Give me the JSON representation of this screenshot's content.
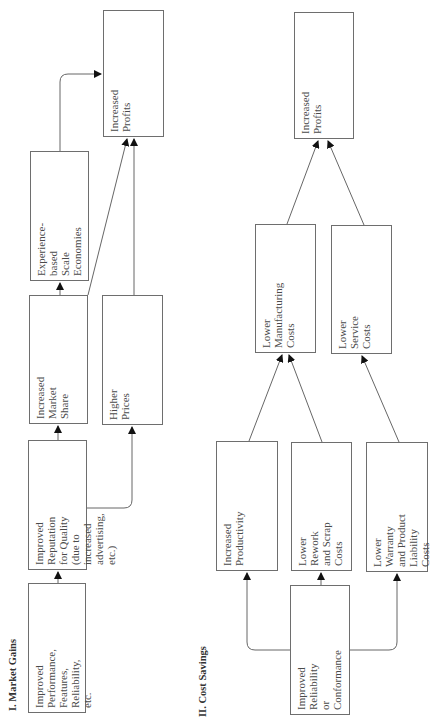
{
  "sections": [
    {
      "title": "I. Market Gains",
      "boxes": {
        "performance": "Improved Performance,\nFeatures, Reliability, etc.",
        "reputation": "Improved Reputation\nfor Quality (due to\nincreased advertising,\netc.)",
        "market_share": "Increased Market\nShare",
        "scale": "Experience-based\nScale Economies",
        "prices": "Higher Prices",
        "profits": "Increased Profits"
      }
    },
    {
      "title": "II. Cost Savings",
      "boxes": {
        "reliability": "Improved Reliability\nor Conformance",
        "productivity": "Increased\nProductivity",
        "rework": "Lower Rework\nand Scrap Costs",
        "warranty": "Lower Warranty\nand Product\nLiability Costs",
        "manufacturing": "Lower\nManufacturing\nCosts",
        "service": "Lower Service\nCosts",
        "profits": "Increased Profits"
      }
    }
  ],
  "colors": {
    "line": "#555555",
    "border": "#6e6e6e",
    "text": "#4a4a4a"
  }
}
